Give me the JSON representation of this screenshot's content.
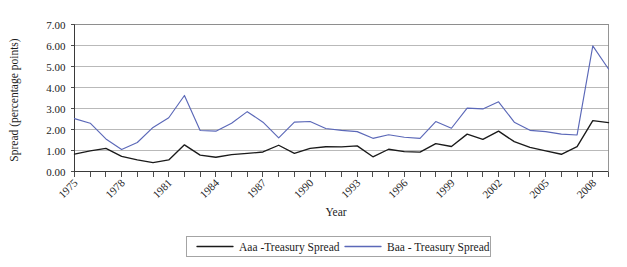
{
  "chart_data": {
    "type": "line",
    "title": "",
    "xlabel": "Year",
    "ylabel": "Spread (percentage points)",
    "xlim": [
      1975,
      2009
    ],
    "ylim": [
      0.0,
      7.0
    ],
    "ytick_step": 1.0,
    "ytick_labels": [
      "0.00",
      "1.00",
      "2.00",
      "3.00",
      "4.00",
      "5.00",
      "6.00",
      "7.00"
    ],
    "ytick_values": [
      0,
      1,
      2,
      3,
      4,
      5,
      6,
      7
    ],
    "xtick_labels": [
      "1975",
      "1978",
      "1981",
      "1984",
      "1987",
      "1990",
      "1993",
      "1996",
      "1999",
      "2002",
      "2005",
      "2008"
    ],
    "xtick_values": [
      1975,
      1978,
      1981,
      1984,
      1987,
      1990,
      1993,
      1996,
      1999,
      2002,
      2005,
      2008
    ],
    "xtick_rotation": -45,
    "grid": "horizontal",
    "legend_position": "bottom-center",
    "x": [
      1975,
      1976,
      1977,
      1978,
      1979,
      1980,
      1981,
      1982,
      1983,
      1984,
      1985,
      1986,
      1987,
      1988,
      1989,
      1990,
      1991,
      1992,
      1993,
      1994,
      1995,
      1996,
      1997,
      1998,
      1999,
      2000,
      2001,
      2002,
      2003,
      2004,
      2005,
      2006,
      2007,
      2008,
      2009
    ],
    "series": [
      {
        "name": "Aaa -Treasury Spread",
        "color": "#1a1a1a",
        "values": [
          0.83,
          0.98,
          1.1,
          0.72,
          0.55,
          0.42,
          0.55,
          1.27,
          0.78,
          0.68,
          0.8,
          0.86,
          0.93,
          1.25,
          0.86,
          1.1,
          1.18,
          1.17,
          1.22,
          0.7,
          1.06,
          0.95,
          0.92,
          1.33,
          1.19,
          1.78,
          1.53,
          1.92,
          1.42,
          1.15,
          0.98,
          0.82,
          1.18,
          2.42,
          2.33
        ]
      },
      {
        "name": "Baa - Treasury Spread",
        "color": "#5b68b8",
        "values": [
          2.52,
          2.3,
          1.55,
          1.05,
          1.38,
          2.1,
          2.56,
          3.62,
          1.95,
          1.92,
          2.3,
          2.85,
          2.35,
          1.6,
          2.35,
          2.38,
          2.05,
          1.96,
          1.9,
          1.58,
          1.75,
          1.63,
          1.58,
          2.38,
          2.06,
          3.02,
          2.98,
          3.32,
          2.35,
          1.96,
          1.9,
          1.78,
          1.74,
          5.98,
          4.88
        ]
      }
    ]
  },
  "axes": {
    "y_title": "Spread (percentage points)",
    "x_title": "Year"
  },
  "legend": {
    "entries": [
      {
        "label": "Aaa -Treasury Spread",
        "color": "#1a1a1a"
      },
      {
        "label": "Baa - Treasury Spread",
        "color": "#5b68b8"
      }
    ]
  }
}
